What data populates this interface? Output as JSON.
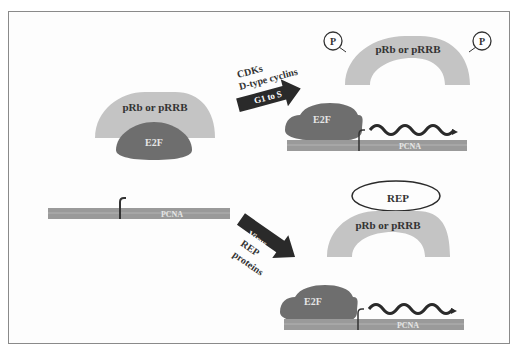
{
  "figure": {
    "colors": {
      "pocket_protein": "#c4c4c4",
      "e2f": "#6e6e6e",
      "dna": "#9a9a9a",
      "arrow": "#2a2a2a",
      "frame": "#8a8a8a",
      "text_dark": "#333333",
      "text_light": "#e6e6e6"
    }
  },
  "panels": {
    "initial_state": {
      "pocket_label": "pRb or pRRB",
      "e2f_label": "E2F",
      "dna_label": "PCNA"
    },
    "g1_to_s": {
      "arrow_label_1": "CDKs",
      "arrow_label_2": "D-type cyclins",
      "arrow_box_label": "G1 to S",
      "pocket_label": "pRb or pRRB",
      "phospho_left": "P",
      "phospho_right": "P",
      "e2f_label": "E2F",
      "dna_label": "PCNA"
    },
    "virus": {
      "arrow_box_label": "Virus",
      "arrow_label_1": "REP",
      "arrow_label_2": "proteins",
      "rep_label": "REP",
      "pocket_label": "pRb or pRRB",
      "e2f_label": "E2F",
      "dna_label": "PCNA"
    }
  }
}
